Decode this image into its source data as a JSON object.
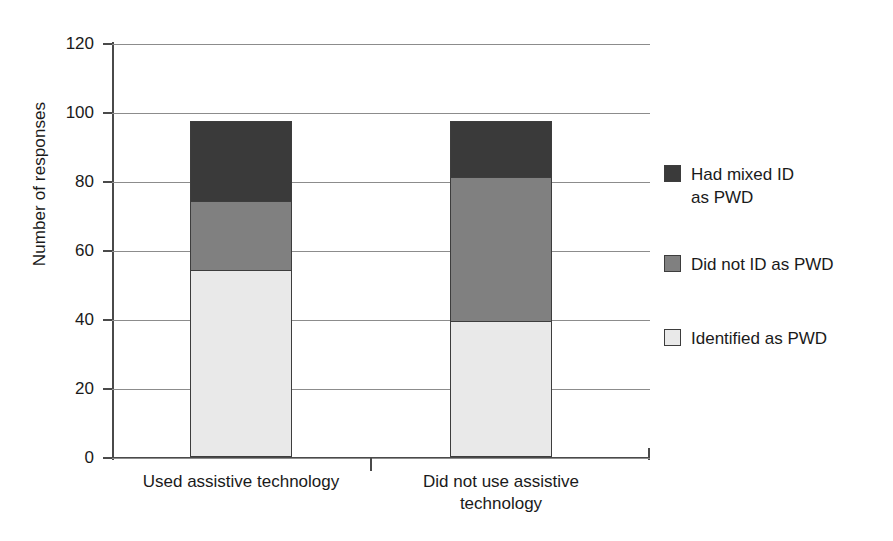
{
  "chart_data": {
    "type": "bar",
    "stacked": true,
    "title": "",
    "xlabel": "",
    "ylabel": "Number of responses",
    "ylim": [
      0,
      120
    ],
    "ytick_step": 20,
    "yticks": [
      120,
      100,
      80,
      60,
      40,
      20,
      0
    ],
    "ytick_labels": [
      "120",
      "100",
      "80",
      "60",
      "40",
      "20",
      "0"
    ],
    "grid": "horizontal",
    "legend_position": "right",
    "categories": [
      "Used assistive technology",
      "Did not use assistive technology"
    ],
    "category_lines": [
      [
        "Used assistive technology"
      ],
      [
        "Did not use assistive",
        "technology"
      ]
    ],
    "series": [
      {
        "name": "Identified as PWD",
        "color": "#e9e9e9",
        "values": [
          54,
          39
        ]
      },
      {
        "name": "Did not ID as PWD",
        "color": "#808080",
        "values": [
          20,
          42
        ]
      },
      {
        "name": "Had mixed ID as PWD",
        "color": "#3a3a3a",
        "values": [
          23,
          16
        ]
      }
    ],
    "stack_order_bottom_to_top": [
      "Identified as PWD",
      "Did not ID as PWD",
      "Had mixed ID as PWD"
    ],
    "totals": [
      97,
      97
    ],
    "legend": [
      {
        "label": "Had mixed ID\nas PWD",
        "color": "#3a3a3a"
      },
      {
        "label": "Did not ID as PWD",
        "color": "#808080"
      },
      {
        "label": "Identified as PWD",
        "color": "#e9e9e9"
      }
    ],
    "colors": {
      "axis": "#4a4a4a",
      "grid": "#8c8c8c",
      "outline": "#3d3d3d",
      "text": "#1a1a1a",
      "background": "#ffffff"
    }
  }
}
